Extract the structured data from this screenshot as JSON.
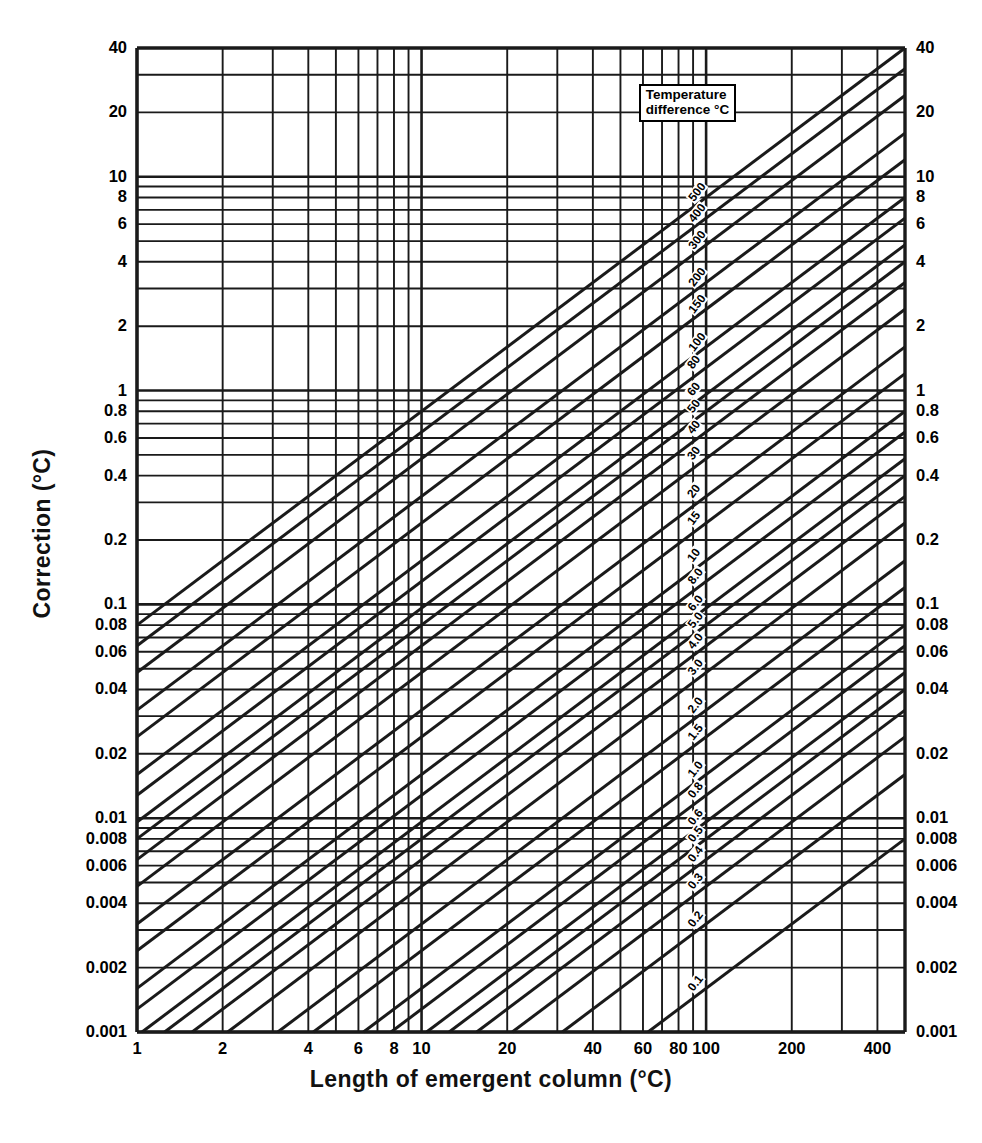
{
  "figure": {
    "title": "",
    "background": "#ffffff",
    "line_color": "#1a1a1a"
  },
  "legend": {
    "line1": "Temperature",
    "line2": "difference °C"
  },
  "axes": {
    "x_title": "Length of emergent column (°C)",
    "y_title": "Correction (°C)",
    "x_tick_labels": [
      "1",
      "2",
      "4",
      "6",
      "8",
      "10",
      "20",
      "40",
      "60",
      "80",
      "100",
      "200",
      "400"
    ],
    "x_tick_values": [
      1,
      2,
      4,
      6,
      8,
      10,
      20,
      40,
      60,
      80,
      100,
      200,
      400
    ],
    "y_tick_labels": [
      "40",
      "20",
      "10",
      "8",
      "6",
      "4",
      "2",
      "1",
      "0.8",
      "0.6",
      "0.4",
      "0.2",
      "0.1",
      "0.08",
      "0.06",
      "0.04",
      "0.02",
      "0.01",
      "0.008",
      "0.006",
      "0.004",
      "0.002",
      "0.001"
    ],
    "y_tick_values": [
      40,
      20,
      10,
      8,
      6,
      4,
      2,
      1,
      0.8,
      0.6,
      0.4,
      0.2,
      0.1,
      0.08,
      0.06,
      0.04,
      0.02,
      0.01,
      0.008,
      0.006,
      0.004,
      0.002,
      0.001
    ]
  },
  "chart_data": {
    "type": "line",
    "title": "",
    "subtitle": "",
    "xlabel": "Length of emergent column (°C)",
    "ylabel": "Correction (°C)",
    "xscale": "log",
    "yscale": "log",
    "xlim": [
      1,
      500
    ],
    "ylim": [
      0.001,
      40
    ],
    "grid": true,
    "legend_position": "inside-top-right",
    "legend_title": "Temperature difference °C",
    "annotations": [
      "Temperature difference °C"
    ],
    "relationship": "correction = 0.00016 * length * temperature_difference",
    "coefficient": 0.00016,
    "series": [
      {
        "name": "500",
        "label": "500",
        "temperature_difference": 500
      },
      {
        "name": "400",
        "label": "400",
        "temperature_difference": 400
      },
      {
        "name": "300",
        "label": "300",
        "temperature_difference": 300
      },
      {
        "name": "200",
        "label": "200",
        "temperature_difference": 200
      },
      {
        "name": "150",
        "label": "150",
        "temperature_difference": 150
      },
      {
        "name": "100",
        "label": "100",
        "temperature_difference": 100
      },
      {
        "name": "80",
        "label": "80",
        "temperature_difference": 80
      },
      {
        "name": "60",
        "label": "60",
        "temperature_difference": 60
      },
      {
        "name": "50",
        "label": "50",
        "temperature_difference": 50
      },
      {
        "name": "40",
        "label": "40",
        "temperature_difference": 40
      },
      {
        "name": "30",
        "label": "30",
        "temperature_difference": 30
      },
      {
        "name": "20",
        "label": "20",
        "temperature_difference": 20
      },
      {
        "name": "15",
        "label": "15",
        "temperature_difference": 15
      },
      {
        "name": "10",
        "label": "10",
        "temperature_difference": 10
      },
      {
        "name": "8.0",
        "label": "8.0",
        "temperature_difference": 8
      },
      {
        "name": "6.0",
        "label": "6.0",
        "temperature_difference": 6
      },
      {
        "name": "5.0",
        "label": "5.0",
        "temperature_difference": 5
      },
      {
        "name": "4.0",
        "label": "4.0",
        "temperature_difference": 4
      },
      {
        "name": "3.0",
        "label": "3.0",
        "temperature_difference": 3
      },
      {
        "name": "2.0",
        "label": "2.0",
        "temperature_difference": 2
      },
      {
        "name": "1.5",
        "label": "1.5",
        "temperature_difference": 1.5
      },
      {
        "name": "1.0",
        "label": "1.0",
        "temperature_difference": 1
      },
      {
        "name": "0.8",
        "label": "0.8",
        "temperature_difference": 0.8
      },
      {
        "name": "0.6",
        "label": "0.6",
        "temperature_difference": 0.6
      },
      {
        "name": "0.5",
        "label": "0.5",
        "temperature_difference": 0.5
      },
      {
        "name": "0.4",
        "label": "0.4",
        "temperature_difference": 0.4
      },
      {
        "name": "0.3",
        "label": "0.3",
        "temperature_difference": 0.3
      },
      {
        "name": "0.2",
        "label": "0.2",
        "temperature_difference": 0.2
      },
      {
        "name": "0.1",
        "label": "0.1",
        "temperature_difference": 0.1
      }
    ]
  }
}
